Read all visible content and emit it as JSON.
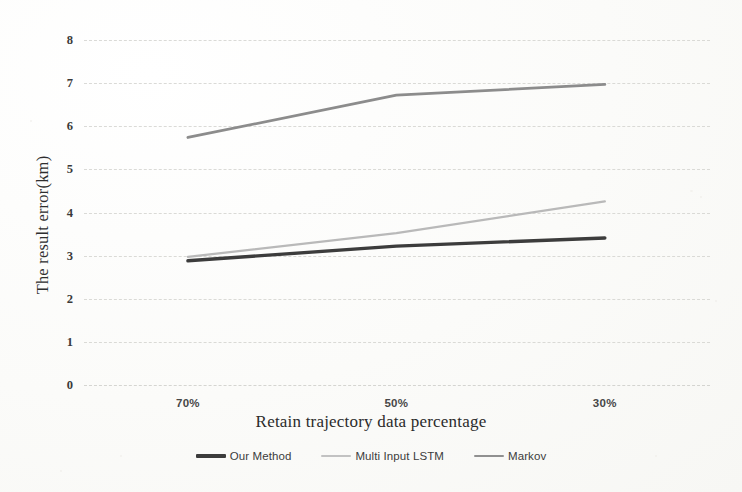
{
  "chart_data": {
    "type": "line",
    "title": "",
    "xlabel": "Retain trajectory data percentage",
    "ylabel": "The result error(km)",
    "categories": [
      "70%",
      "50%",
      "30%"
    ],
    "x": [
      0,
      1,
      2
    ],
    "ylim": [
      0,
      8
    ],
    "yticks": [
      0,
      1,
      2,
      3,
      4,
      5,
      6,
      7,
      8
    ],
    "ytick_labels": [
      "0",
      "1",
      "2",
      "3",
      "4",
      "5",
      "6",
      "7",
      "8"
    ],
    "grid": true,
    "grid_axis": "y",
    "legend_position": "bottom",
    "series": [
      {
        "name": "Our Method",
        "color": "#3c3c3c",
        "width": 3.4,
        "values": [
          2.88,
          3.22,
          3.41
        ]
      },
      {
        "name": "Multi Input LSTM",
        "color": "#b9b9b9",
        "width": 2.2,
        "values": [
          2.97,
          3.52,
          4.26
        ]
      },
      {
        "name": "Markov",
        "color": "#8c8c8c",
        "width": 2.8,
        "values": [
          5.74,
          6.72,
          6.97
        ]
      }
    ]
  },
  "axes": {
    "y_title": "The result error(km)",
    "x_title": "Retain trajectory data percentage",
    "y_labels": [
      "8",
      "7",
      "6",
      "5",
      "4",
      "3",
      "2",
      "1",
      "0"
    ],
    "x_labels": [
      "70%",
      "50%",
      "30%"
    ]
  },
  "legend": {
    "items": [
      {
        "label": "Our Method",
        "color": "#3c3c3c",
        "thickness": "4px"
      },
      {
        "label": "Multi Input LSTM",
        "color": "#c2c2c2",
        "thickness": "2px"
      },
      {
        "label": "Markov",
        "color": "#909090",
        "thickness": "2px"
      }
    ]
  }
}
